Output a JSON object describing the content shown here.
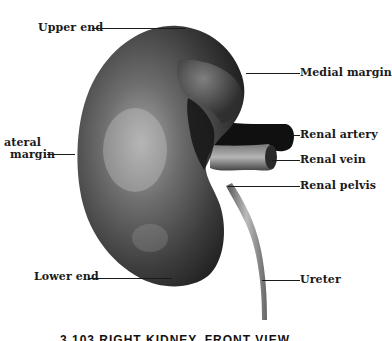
{
  "figure": {
    "subject": "Right kidney, front view",
    "caption": "3.103  RIGHT KIDNEY, FRONT VIEW",
    "colors": {
      "background": "#ffffff",
      "kidney_dark": "#2a2a2a",
      "kidney_mid": "#5a5a5a",
      "kidney_light": "#9a9a9a",
      "vessel_dark": "#111111",
      "label_text": "#1a1a1a"
    }
  },
  "labels": {
    "upper_end": "Upper end",
    "medial_margin": "Medial margin",
    "renal_artery": "Renal artery",
    "renal_vein": "Renal vein",
    "renal_pelvis": "Renal pelvis",
    "lateral_margin_line1": "ateral",
    "lateral_margin_line2": "margin",
    "lower_end": "Lower end",
    "ureter": "Ureter"
  }
}
